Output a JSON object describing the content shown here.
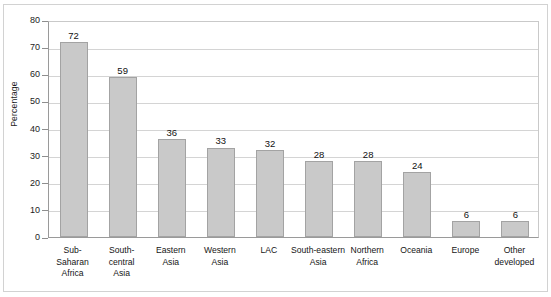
{
  "chart_data": {
    "type": "bar",
    "title": "",
    "xlabel": "",
    "ylabel": "Percentage",
    "ylim": [
      0,
      80
    ],
    "yticks": [
      0,
      10,
      20,
      30,
      40,
      50,
      60,
      70,
      80
    ],
    "grid": true,
    "legend": "none",
    "categories": [
      "Sub-\nSaharan\nAfrica",
      "South-\ncentral\nAsia",
      "Eastern\nAsia",
      "Western\nAsia",
      "LAC",
      "South-eastern\nAsia",
      "Northern\nAfrica",
      "Oceania",
      "Europe",
      "Other\ndeveloped"
    ],
    "values": [
      72,
      59,
      36,
      33,
      32,
      28,
      28,
      24,
      6,
      6
    ],
    "colors": {
      "bar_fill": "#c9c9c9",
      "bar_border": "#a3a3a3",
      "gridline": "#d4d4d4",
      "axis": "#9a9a9a",
      "frame": "#d2d2d2",
      "text": "#151515",
      "background": "#ffffff"
    }
  }
}
